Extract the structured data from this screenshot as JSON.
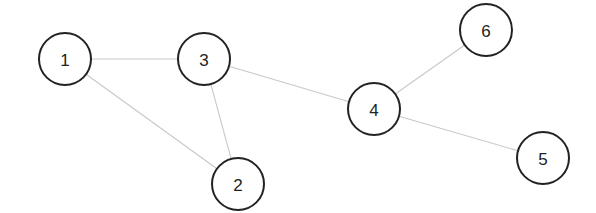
{
  "graph": {
    "type": "undirected",
    "nodes": [
      {
        "id": "1",
        "label": "1"
      },
      {
        "id": "2",
        "label": "2"
      },
      {
        "id": "3",
        "label": "3"
      },
      {
        "id": "4",
        "label": "4"
      },
      {
        "id": "5",
        "label": "5"
      },
      {
        "id": "6",
        "label": "6"
      }
    ],
    "edges": [
      {
        "source": "1",
        "target": "3"
      },
      {
        "source": "1",
        "target": "2"
      },
      {
        "source": "3",
        "target": "2"
      },
      {
        "source": "3",
        "target": "4"
      },
      {
        "source": "4",
        "target": "6"
      },
      {
        "source": "4",
        "target": "5"
      }
    ],
    "colors": {
      "edge": "#c8c8c8",
      "node_stroke": "#222222",
      "node_fill": "#ffffff",
      "label": "#222222"
    }
  }
}
